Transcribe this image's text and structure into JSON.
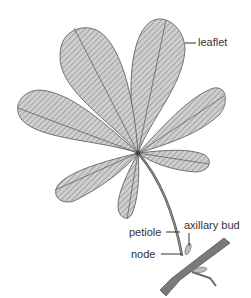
{
  "diagram": {
    "labels": {
      "leaflet": "leaflet",
      "axillary_bud": "axillary bud",
      "petiole": "petiole",
      "node": "node"
    },
    "colors": {
      "leaf_fill": "#c8c8c8",
      "leaf_stroke": "#555555",
      "vein": "#666666",
      "stem": "#7a7a7a",
      "label_text": "#333333"
    }
  }
}
